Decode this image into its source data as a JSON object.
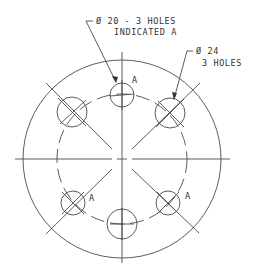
{
  "drawing": {
    "labels": {
      "small_holes_line1": "Ø 20 - 3 HOLES",
      "small_holes_line2": "INDICATED A",
      "large_holes_line1": "Ø 24",
      "large_holes_line2": "3 HOLES",
      "hole_mark_top": "A",
      "hole_mark_lower_left": "A",
      "hole_mark_lower_right": "A"
    },
    "geometry": {
      "center": [
        122,
        159
      ],
      "outer_radius": 98,
      "bolt_circle_radius": 65,
      "small_hole_diameter": 20,
      "large_hole_diameter": 24,
      "small_hole_count": 3,
      "large_hole_count": 3
    },
    "colors": {
      "line": "#4a4a4a",
      "text": "#333333",
      "background": "#ffffff"
    }
  }
}
